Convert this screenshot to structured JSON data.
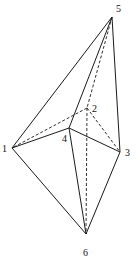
{
  "diagram": {
    "title": "",
    "vertices": [
      {
        "id": "1",
        "label": "1",
        "x": 12,
        "y": 148,
        "lx": 2,
        "ly": 152
      },
      {
        "id": "2",
        "label": "2",
        "x": 87,
        "y": 108,
        "lx": 92,
        "ly": 112
      },
      {
        "id": "3",
        "label": "3",
        "x": 120,
        "y": 152,
        "lx": 125,
        "ly": 156
      },
      {
        "id": "4",
        "label": "4",
        "x": 69,
        "y": 128,
        "lx": 62,
        "ly": 142
      },
      {
        "id": "5",
        "label": "5",
        "x": 112,
        "y": 17,
        "lx": 116,
        "ly": 12
      },
      {
        "id": "6",
        "label": "6",
        "x": 86,
        "y": 234,
        "lx": 83,
        "ly": 256
      }
    ],
    "solid_edges": [
      [
        "1",
        "5"
      ],
      [
        "5",
        "3"
      ],
      [
        "5",
        "4"
      ],
      [
        "1",
        "4"
      ],
      [
        "4",
        "3"
      ],
      [
        "1",
        "6"
      ],
      [
        "4",
        "6"
      ],
      [
        "3",
        "6"
      ]
    ],
    "dashed_edges": [
      [
        "5",
        "2"
      ],
      [
        "2",
        "1"
      ],
      [
        "2",
        "3"
      ],
      [
        "2",
        "6"
      ]
    ]
  }
}
